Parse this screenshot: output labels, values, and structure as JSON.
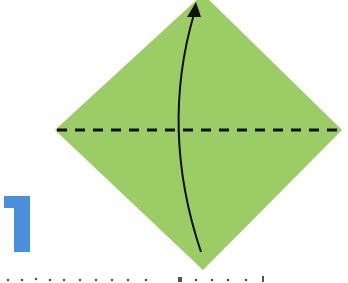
{
  "step": {
    "number": "1",
    "number_color": "#4a90d9"
  },
  "paper": {
    "shape": "square-rotated-45-diamond",
    "fill_color": "#9ccc65",
    "top_tip": [
      203,
      -6
    ],
    "left_tip": [
      55,
      130
    ],
    "right_tip": [
      342,
      130
    ],
    "bottom_tip": [
      203,
      270
    ]
  },
  "fold_line": {
    "type": "valley-fold-dashed",
    "y": 130,
    "x_start": 55,
    "x_end": 342,
    "color": "#111111"
  },
  "arrow": {
    "type": "curved-fold-arrow",
    "direction": "up",
    "start": [
      201,
      252
    ],
    "control": [
      160,
      130
    ],
    "end": [
      195,
      6
    ],
    "color": "#111111"
  },
  "caption": {
    "text_fragment_visible": "partially cropped instruction text (illegible)"
  }
}
